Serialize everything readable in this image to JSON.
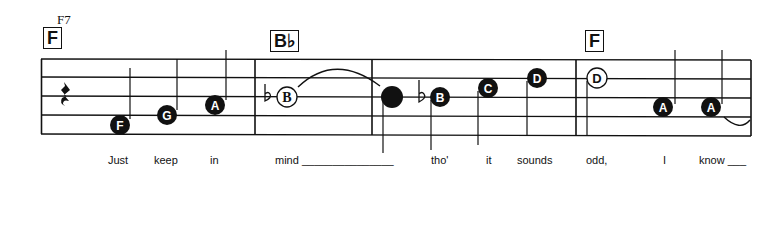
{
  "chords": {
    "label_above": "F7",
    "boxes": [
      {
        "name": "F",
        "x": 41
      },
      {
        "name": "B♭",
        "x": 270
      },
      {
        "name": "F",
        "x": 585
      }
    ]
  },
  "notes": [
    {
      "letter": "F",
      "style": "filled"
    },
    {
      "letter": "G",
      "style": "filled"
    },
    {
      "letter": "A",
      "style": "filled"
    },
    {
      "letter": "B",
      "style": "open",
      "accidental": "flat"
    },
    {
      "letter": "",
      "style": "filled-large"
    },
    {
      "letter": "B",
      "style": "filled",
      "accidental": "flat"
    },
    {
      "letter": "C",
      "style": "filled"
    },
    {
      "letter": "D",
      "style": "filled"
    },
    {
      "letter": "D",
      "style": "open"
    },
    {
      "letter": "A",
      "style": "filled"
    },
    {
      "letter": "A",
      "style": "filled"
    }
  ],
  "lyrics": [
    {
      "text": "Just",
      "x": 108
    },
    {
      "text": "keep",
      "x": 154
    },
    {
      "text": "in",
      "x": 210
    },
    {
      "text": "mind _______________",
      "x": 275
    },
    {
      "text": "tho'",
      "x": 431
    },
    {
      "text": "it",
      "x": 486
    },
    {
      "text": "sounds",
      "x": 517
    },
    {
      "text": "odd,",
      "x": 586
    },
    {
      "text": "I",
      "x": 663
    },
    {
      "text": "know ___",
      "x": 699
    }
  ],
  "rest": "quarter-rest"
}
